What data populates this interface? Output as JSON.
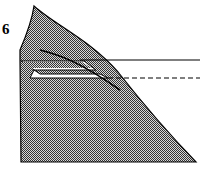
{
  "diagram": {
    "step_number": "6",
    "colors": {
      "paper_fill": "#9a9a9a",
      "outline": "#000000",
      "background": "#ffffff",
      "pocket": "#ffffff"
    },
    "elements": [
      "shaded-paper-shape",
      "curved-crease-line",
      "white-pocket-fold",
      "solid-reference-line",
      "dashed-fold-line"
    ]
  }
}
